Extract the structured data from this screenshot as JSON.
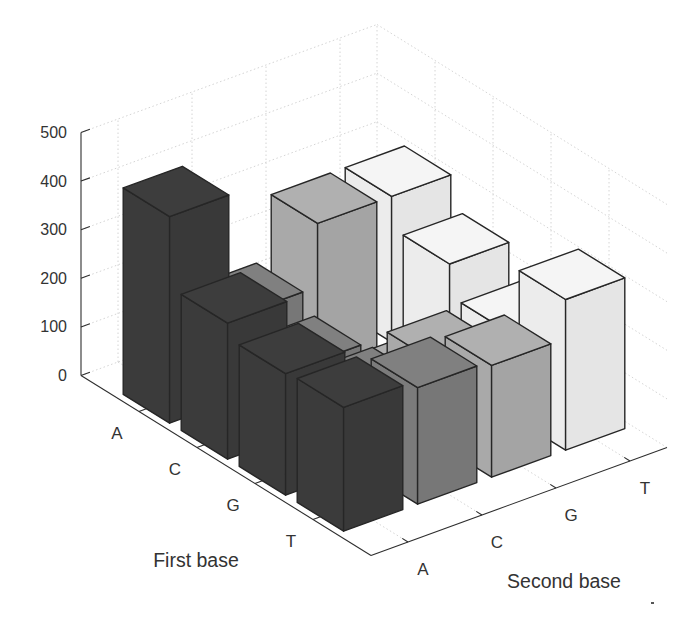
{
  "chart_data": {
    "type": "bar",
    "variant": "3d",
    "title": "",
    "xlabel": "Second base",
    "ylabel": "First base",
    "zlabel": "",
    "x_categories": [
      "A",
      "C",
      "G",
      "T"
    ],
    "y_categories": [
      "A",
      "C",
      "G",
      "T"
    ],
    "zlim": [
      0,
      500
    ],
    "zticks": [
      0,
      100,
      200,
      300,
      400,
      500
    ],
    "grid": true,
    "legend": "none",
    "series_axis": "Second base",
    "category_axis": "First base",
    "series": [
      {
        "name": "A",
        "color": "#3b3b3b",
        "values": [
          425,
          280,
          250,
          255
        ]
      },
      {
        "name": "C",
        "color": "#7b7b7b",
        "values": [
          170,
          135,
          145,
          240
        ]
      },
      {
        "name": "G",
        "color": "#a9a9a9",
        "values": [
          300,
          25,
          165,
          230
        ]
      },
      {
        "name": "T",
        "color": "#ececec",
        "values": [
          300,
          235,
          170,
          310
        ]
      }
    ]
  }
}
